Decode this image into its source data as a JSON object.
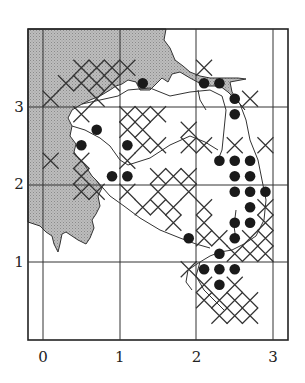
{
  "chart_data": {
    "type": "scatter",
    "title": "",
    "xlabel": "",
    "ylabel": "",
    "x_ticks": [
      "0",
      "1",
      "2",
      "3"
    ],
    "y_ticks": [
      "1",
      "2",
      "3"
    ],
    "xlim": [
      -0.2,
      3.2
    ],
    "ylim": [
      0,
      3.9
    ],
    "grid": true,
    "legend": [],
    "series": [
      {
        "name": "filled-circle records",
        "marker": "dot",
        "points": [
          [
            1.3,
            3.3
          ],
          [
            2.1,
            3.3
          ],
          [
            2.3,
            3.3
          ],
          [
            2.5,
            3.1
          ],
          [
            2.5,
            2.9
          ],
          [
            0.7,
            2.7
          ],
          [
            0.5,
            2.5
          ],
          [
            1.1,
            2.5
          ],
          [
            0.9,
            2.1
          ],
          [
            1.1,
            2.1
          ],
          [
            2.3,
            2.3
          ],
          [
            2.5,
            2.3
          ],
          [
            2.7,
            2.3
          ],
          [
            2.5,
            2.1
          ],
          [
            2.7,
            2.1
          ],
          [
            2.5,
            1.9
          ],
          [
            2.7,
            1.9
          ],
          [
            2.9,
            1.9
          ],
          [
            2.7,
            1.7
          ],
          [
            2.5,
            1.5
          ],
          [
            2.7,
            1.5
          ],
          [
            2.5,
            1.3
          ],
          [
            1.9,
            1.3
          ],
          [
            2.3,
            1.1
          ],
          [
            2.1,
            0.9
          ],
          [
            2.3,
            0.9
          ],
          [
            2.5,
            0.9
          ],
          [
            2.3,
            0.7
          ]
        ]
      },
      {
        "name": "cross records",
        "marker": "x",
        "points": [
          [
            0.5,
            3.5
          ],
          [
            0.7,
            3.5
          ],
          [
            0.9,
            3.5
          ],
          [
            1.1,
            3.5
          ],
          [
            0.3,
            3.3
          ],
          [
            0.5,
            3.3
          ],
          [
            0.7,
            3.3
          ],
          [
            0.9,
            3.3
          ],
          [
            0.1,
            3.1
          ],
          [
            0.7,
            3.1
          ],
          [
            2.1,
            3.5
          ],
          [
            2.7,
            3.1
          ],
          [
            0.5,
            2.9
          ],
          [
            1.1,
            2.9
          ],
          [
            1.3,
            2.9
          ],
          [
            1.5,
            2.9
          ],
          [
            1.1,
            2.7
          ],
          [
            1.3,
            2.7
          ],
          [
            1.3,
            2.5
          ],
          [
            1.5,
            2.5
          ],
          [
            1.9,
            2.7
          ],
          [
            1.9,
            2.5
          ],
          [
            2.1,
            2.5
          ],
          [
            2.9,
            2.5
          ],
          [
            2.5,
            2.5
          ],
          [
            0.5,
            2.3
          ],
          [
            0.5,
            2.1
          ],
          [
            0.5,
            1.9
          ],
          [
            0.7,
            1.9
          ],
          [
            0.1,
            2.3
          ],
          [
            1.5,
            2.1
          ],
          [
            1.5,
            1.9
          ],
          [
            1.3,
            1.7
          ],
          [
            1.1,
            1.9
          ],
          [
            1.9,
            2.1
          ],
          [
            1.9,
            1.9
          ],
          [
            1.7,
            2.1
          ],
          [
            1.1,
            2.3
          ],
          [
            1.5,
            1.7
          ],
          [
            1.7,
            1.7
          ],
          [
            1.7,
            1.5
          ],
          [
            2.1,
            1.7
          ],
          [
            2.9,
            1.7
          ],
          [
            2.9,
            1.5
          ],
          [
            2.1,
            1.5
          ],
          [
            2.1,
            1.3
          ],
          [
            2.3,
            1.3
          ],
          [
            2.7,
            1.3
          ],
          [
            2.9,
            1.3
          ],
          [
            2.9,
            1.1
          ],
          [
            2.7,
            1.1
          ],
          [
            2.5,
            1.1
          ],
          [
            1.9,
            0.9
          ],
          [
            2.1,
            0.7
          ],
          [
            2.5,
            0.7
          ],
          [
            2.3,
            0.5
          ],
          [
            2.5,
            0.5
          ],
          [
            2.7,
            0.5
          ],
          [
            2.1,
            0.5
          ],
          [
            2.3,
            0.3
          ],
          [
            2.5,
            0.3
          ],
          [
            2.7,
            0.3
          ]
        ]
      }
    ],
    "annotations": [
      "shaded (sea/outside) area in upper-left and left"
    ]
  }
}
